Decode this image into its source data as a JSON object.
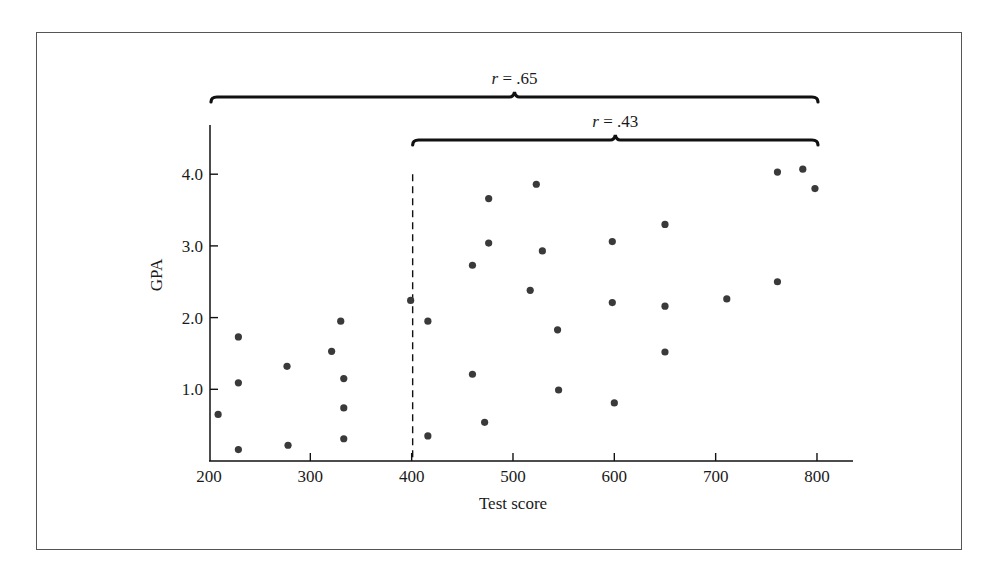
{
  "chart_data": {
    "type": "scatter",
    "title": "",
    "xlabel": "Test score",
    "ylabel": "GPA",
    "xlim": [
      200,
      835
    ],
    "ylim": [
      0,
      4.7
    ],
    "x_ticks": [
      200,
      300,
      400,
      500,
      600,
      700,
      800
    ],
    "x_tick_labels": [
      "200",
      "300",
      "400",
      "500",
      "600",
      "700",
      "800"
    ],
    "y_ticks": [
      1.0,
      2.0,
      3.0,
      4.0
    ],
    "y_tick_labels": [
      "1.0",
      "2.0",
      "3.0",
      "4.0"
    ],
    "grid": false,
    "legend": null,
    "marker_color": "#3a3a3a",
    "annotations": [
      {
        "type": "brace",
        "x_from": 200,
        "x_to": 800,
        "label_var": "r",
        "label_value": " = .65",
        "label": "r = .65"
      },
      {
        "type": "brace",
        "x_from": 400,
        "x_to": 800,
        "label_var": "r",
        "label_value": " = .43",
        "label": "r = .43"
      },
      {
        "type": "dashed-vline",
        "x": 400,
        "y_from": 0,
        "y_to": 4.0
      }
    ],
    "series": [
      {
        "name": "Students",
        "points": [
          [
            209,
            0.65
          ],
          [
            229,
            1.73
          ],
          [
            229,
            1.09
          ],
          [
            229,
            0.16
          ],
          [
            277,
            1.32
          ],
          [
            278,
            0.22
          ],
          [
            321,
            1.53
          ],
          [
            330,
            1.95
          ],
          [
            333,
            1.15
          ],
          [
            333,
            0.74
          ],
          [
            333,
            0.31
          ],
          [
            399,
            2.24
          ],
          [
            416,
            1.95
          ],
          [
            416,
            0.35
          ],
          [
            460,
            2.73
          ],
          [
            460,
            1.21
          ],
          [
            472,
            0.54
          ],
          [
            476,
            3.66
          ],
          [
            476,
            3.04
          ],
          [
            517,
            2.38
          ],
          [
            523,
            3.86
          ],
          [
            529,
            2.93
          ],
          [
            544,
            1.83
          ],
          [
            545,
            0.99
          ],
          [
            598,
            3.06
          ],
          [
            598,
            2.21
          ],
          [
            600,
            0.81
          ],
          [
            650,
            3.3
          ],
          [
            650,
            2.16
          ],
          [
            650,
            1.52
          ],
          [
            711,
            2.26
          ],
          [
            761,
            4.03
          ],
          [
            761,
            2.5
          ],
          [
            786,
            4.07
          ],
          [
            798,
            3.8
          ]
        ]
      }
    ]
  }
}
